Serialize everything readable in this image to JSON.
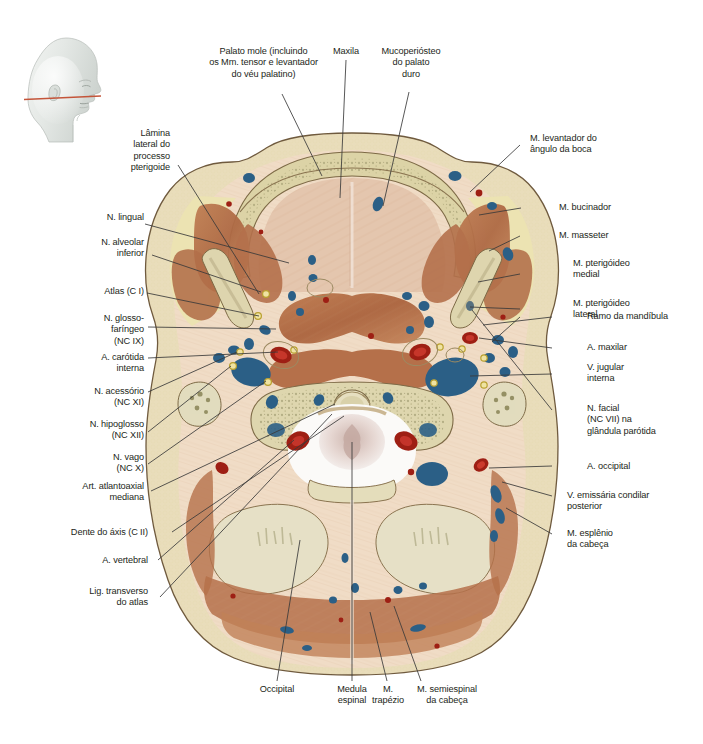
{
  "figure": {
    "type": "anatomical-cross-section",
    "title_visible": false,
    "language": "pt-BR",
    "orientation_icon": {
      "name": "head-profile-icon",
      "description": "Perfil lateral da cabeça com linha de secção",
      "section_line_color": "#c4553a",
      "head_fill": "#e3e6e3"
    },
    "palette": {
      "fat": "#ece6c0",
      "skin_outline": "#6f5a3e",
      "connective": "#efd9c3",
      "muscle": "#b5704a",
      "muscle_light": "#c98d65",
      "bone_cortex": "#d8cfa8",
      "bone_marrow": "#ded7b4",
      "cartilage": "#e8e3cc",
      "vein": "#2b5f86",
      "artery": "#9e1f14",
      "nerve": "#e8d24a",
      "cord": "#f3f0ee",
      "leader_line": "#3a3a3a"
    }
  },
  "labels": {
    "top": [
      {
        "id": "palato-mole",
        "text": "Palato mole (incluindo\nos Mm. tensor e levantador\ndo véu palatino)"
      },
      {
        "id": "maxila",
        "text": "Maxila"
      },
      {
        "id": "mucoperiosteo",
        "text": "Mucoperiósteo\ndo palato\nduro"
      }
    ],
    "left": [
      {
        "id": "lamina-lateral",
        "text": "Lâmina\nlateral do\nprocesso\npterigoide"
      },
      {
        "id": "n-lingual",
        "text": "N. lingual"
      },
      {
        "id": "n-alveolar-inferior",
        "text": "N. alveolar\ninferior"
      },
      {
        "id": "atlas-c1",
        "text": "Atlas (C I)"
      },
      {
        "id": "n-glossofaringeo",
        "text": "N. glosso-\nfaríngeo\n(NC IX)"
      },
      {
        "id": "a-carotida-interna",
        "text": "A. carótida\ninterna"
      },
      {
        "id": "n-acessorio",
        "text": "N. acessório\n(NC XI)"
      },
      {
        "id": "n-hipoglosso",
        "text": "N. hipoglosso\n(NC XII)"
      },
      {
        "id": "n-vago",
        "text": "N. vago\n(NC X)"
      },
      {
        "id": "art-atlantoaxial",
        "text": "Art. atlantoaxial\nmediana"
      },
      {
        "id": "dente-do-axis",
        "text": "Dente do áxis (C II)"
      },
      {
        "id": "a-vertebral",
        "text": "A. vertebral"
      },
      {
        "id": "lig-transverso",
        "text": "Lig. transverso\ndo atlas"
      }
    ],
    "right": [
      {
        "id": "m-levantador-angulo",
        "text": "M. levantador do\nângulo da boca"
      },
      {
        "id": "m-bucinador",
        "text": "M. bucinador"
      },
      {
        "id": "m-masseter",
        "text": "M. masseter"
      },
      {
        "id": "m-pterigoideo-medial",
        "text": "M. pterigóideo\nmedial"
      },
      {
        "id": "m-pterigoideo-lateral",
        "text": "M. pterigóideo\nlateral"
      },
      {
        "id": "ramo-da-mandibula",
        "text": "Ramo da mandíbula"
      },
      {
        "id": "a-maxilar",
        "text": "A. maxilar"
      },
      {
        "id": "v-jugular-interna",
        "text": "V. jugular\ninterna"
      },
      {
        "id": "n-facial",
        "text": "N. facial\n(NC VII) na\nglândula parótida"
      },
      {
        "id": "a-occipital",
        "text": "A. occipital"
      },
      {
        "id": "v-emissaria",
        "text": "V. emissária condilar\nposterior"
      },
      {
        "id": "m-esplenio",
        "text": "M. esplênio\nda cabeça"
      }
    ],
    "bottom": [
      {
        "id": "occipital",
        "text": "Occipital"
      },
      {
        "id": "medula-espinal",
        "text": "Medula\nespinal"
      },
      {
        "id": "m-trapezio",
        "text": "M.\ntrapézio"
      },
      {
        "id": "m-semiespinal",
        "text": "M. semiespinal\nda cabeça"
      }
    ]
  }
}
